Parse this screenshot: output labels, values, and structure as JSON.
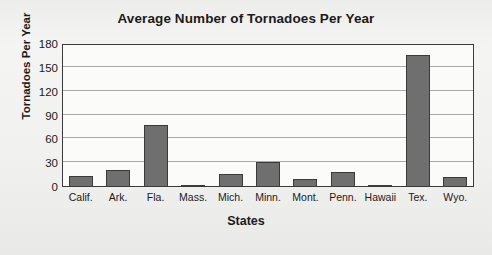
{
  "chart_data": {
    "type": "bar",
    "title": "Average Number of Tornadoes Per Year",
    "xlabel": "States",
    "ylabel": "Tornadoes Per Year",
    "categories": [
      "Calif.",
      "Ark.",
      "Fla.",
      "Mass.",
      "Mich.",
      "Minn.",
      "Mont.",
      "Penn.",
      "Hawaii",
      "Tex.",
      "Wyo."
    ],
    "values": [
      14,
      21,
      78,
      2,
      16,
      32,
      10,
      19,
      1,
      166,
      12
    ],
    "ylim": [
      0,
      180
    ],
    "yticks": [
      0,
      30,
      60,
      90,
      120,
      150,
      180
    ],
    "ytick_labels": [
      "0",
      "30",
      "60",
      "90",
      "120",
      "150",
      "180"
    ],
    "grid": true,
    "legend": "none",
    "bar_color": "#6f6f6f",
    "bar_edge_color": "#3a3a3a",
    "plot_background": "#fbfbfa",
    "page_background": "#f2f2f0",
    "text_color": "#1b1b1b",
    "gridline_color": "#a9a9a9"
  }
}
